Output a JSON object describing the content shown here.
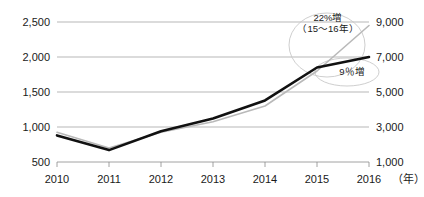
{
  "chart_data": {
    "type": "line",
    "title": "",
    "xlabel": "",
    "ylabel": "",
    "grid": true,
    "legend": "none",
    "categories": [
      "2010",
      "2011",
      "2012",
      "2013",
      "2014",
      "2015",
      "2016"
    ],
    "x_unit": "（年）",
    "axes": {
      "left": {
        "ticks": [
          "500",
          "1,000",
          "1,500",
          "2,000",
          "2,500"
        ],
        "values": [
          500,
          1000,
          1500,
          2000,
          2500
        ],
        "ylim": [
          500,
          2500
        ]
      },
      "right": {
        "ticks": [
          "1,000",
          "3,000",
          "5,000",
          "7,000",
          "9,000"
        ],
        "values": [
          1000,
          3000,
          5000,
          7000,
          9000
        ],
        "ylim": [
          1000,
          9000
        ]
      }
    },
    "series": [
      {
        "name": "black-series",
        "axis": "left",
        "color": "#111111",
        "width": 2.6,
        "values": [
          880,
          670,
          940,
          1120,
          1380,
          1850,
          2000
        ]
      },
      {
        "name": "gray-series",
        "axis": "right",
        "color": "#b9b9b9",
        "width": 1.6,
        "values": [
          2700,
          1800,
          2700,
          3300,
          4200,
          6200,
          8800
        ]
      }
    ],
    "annotations": [
      {
        "name": "growth-22",
        "line1": "22%増",
        "line2": "（15〜16年）"
      },
      {
        "name": "growth-9",
        "line1": "9％増"
      }
    ],
    "colors": {
      "grid": "#9a9a9a",
      "axis": "#8a8a8a",
      "text": "#1a1a1a",
      "black_line": "#111111",
      "gray_line": "#b9b9b9",
      "callout": "#c8c8c8"
    }
  }
}
